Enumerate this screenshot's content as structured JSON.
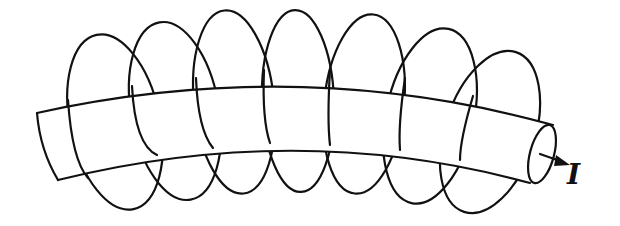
{
  "diagram": {
    "current_label": "I",
    "field_loop_count": 7,
    "colors": {
      "line": "#111111",
      "background": "#ffffff"
    }
  }
}
